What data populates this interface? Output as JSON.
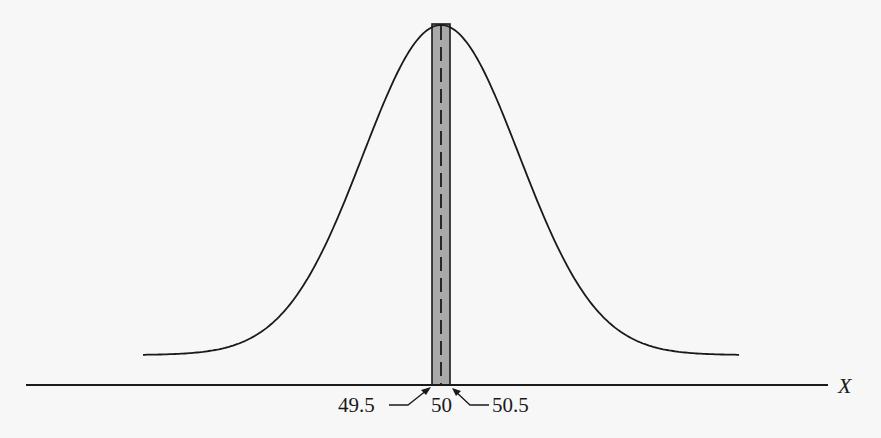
{
  "chart_data": {
    "type": "area",
    "distribution": "normal",
    "mean": 50,
    "highlighted_interval": [
      49.5,
      50.5
    ],
    "xlabel": "X",
    "ylabel": "",
    "annotations": [
      {
        "text": "49.5",
        "points_to": 49.5
      },
      {
        "text": "50",
        "points_to": 50
      },
      {
        "text": "50.5",
        "points_to": 50.5
      }
    ],
    "center_line": "dashed"
  },
  "labels": {
    "left": "49.5",
    "center": "50",
    "right": "50.5",
    "axis": "X"
  },
  "colors": {
    "curve": "#1a1a1a",
    "strip_fill": "#a9a9a9",
    "background": "#f7f7f7"
  }
}
